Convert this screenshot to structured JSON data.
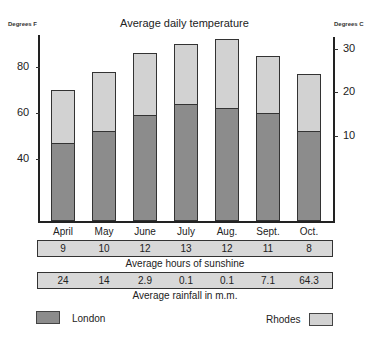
{
  "chart_data": {
    "type": "bar",
    "stacked_overlay": true,
    "title": "Average daily temperature",
    "ylabel_left": "Degrees F",
    "ylabel_right": "Degrees C",
    "categories": [
      "April",
      "May",
      "June",
      "July",
      "Aug.",
      "Sept.",
      "Oct."
    ],
    "series": [
      {
        "name": "London",
        "color": "#8c8c8c",
        "values": [
          47,
          52,
          59,
          64,
          62,
          60,
          52
        ]
      },
      {
        "name": "Rhodes",
        "color": "#d2d2d2",
        "values": [
          70,
          78,
          86,
          90,
          92,
          85,
          77
        ]
      }
    ],
    "y_left_ticks": [
      40,
      60,
      80
    ],
    "y_right_ticks": [
      10,
      20,
      30
    ],
    "tables": [
      {
        "caption": "Average hours of sunshine",
        "values": [
          "9",
          "10",
          "12",
          "13",
          "12",
          "11",
          "8"
        ]
      },
      {
        "caption": "Average rainfall in m.m.",
        "values": [
          "24",
          "14",
          "2.9",
          "0.1",
          "0.1",
          "7.1",
          "64.3"
        ]
      }
    ],
    "legend": [
      {
        "label": "London",
        "color": "#8c8c8c",
        "position": "bottom-left"
      },
      {
        "label": "Rhodes",
        "color": "#d2d2d2",
        "position": "bottom-right"
      }
    ],
    "grid": false
  },
  "labels": {
    "title": "Average daily temperature",
    "left_unit": "Degrees F",
    "right_unit": "Degrees C",
    "left_ticks": [
      "80",
      "60",
      "40"
    ],
    "right_ticks": [
      "30",
      "20",
      "10"
    ],
    "months": [
      "April",
      "May",
      "June",
      "July",
      "Aug.",
      "Sept.",
      "Oct."
    ],
    "sunshine": [
      "9",
      "10",
      "12",
      "13",
      "12",
      "11",
      "8"
    ],
    "sunshine_caption": "Average hours of sunshine",
    "rainfall": [
      "24",
      "14",
      "2.9",
      "0.1",
      "0.1",
      "7.1",
      "64.3"
    ],
    "rainfall_caption": "Average rainfall in m.m.",
    "legend_london": "London",
    "legend_rhodes": "Rhodes"
  }
}
